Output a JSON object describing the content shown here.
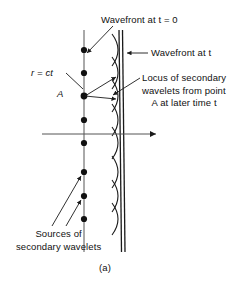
{
  "figure": {
    "panel_label": "(a)",
    "labels": {
      "wavefront_t0": "Wavefront at t  =  0",
      "wavefront_t": "Wavefront at t",
      "locus_line1": "Locus of secondary",
      "locus_line2": "wavelets from point",
      "locus_line3": "A at later time t",
      "radius": "r  =  ct",
      "point_a": "A",
      "sources_line1": "Sources of",
      "sources_line2": "secondary wavelets"
    },
    "colors": {
      "ink": "#111111",
      "background": "#ffffff",
      "line": "#1a1a1a"
    },
    "geometry": {
      "initial_wavefront_x": 84,
      "later_wavefront_x": 120,
      "propagation_axis_y": 134,
      "propagation_axis_x_start": 42,
      "propagation_axis_x_end": 158,
      "source_points_y": [
        50,
        73,
        96,
        120,
        143,
        172,
        196,
        219
      ],
      "point_a_y": 96,
      "wavelet_radius": 36,
      "wavelet_count": 8
    }
  }
}
